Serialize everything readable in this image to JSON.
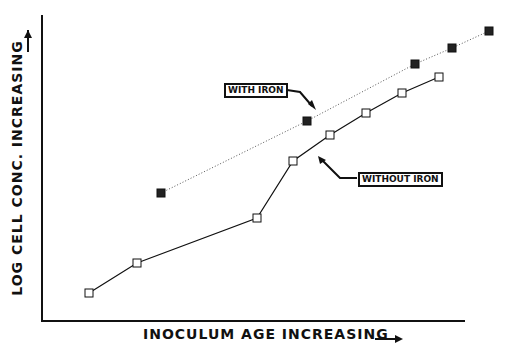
{
  "chart_data": {
    "type": "line",
    "title": "",
    "xlabel": "INOCULUM AGE INCREASING",
    "ylabel": "LOG CELL CONC. INCREASING",
    "grid": false,
    "legend": "annotations in boxes with arrows",
    "series": [
      {
        "name": "WITHOUT IRON",
        "style": "solid line, open squares",
        "points": [
          [
            89,
            293
          ],
          [
            137,
            263
          ],
          [
            257,
            218
          ],
          [
            293,
            161
          ],
          [
            330,
            135
          ],
          [
            366,
            113
          ],
          [
            402,
            93
          ],
          [
            439,
            77
          ]
        ]
      },
      {
        "name": "WITH IRON",
        "style": "dotted line, filled squares",
        "points": [
          [
            161,
            193
          ],
          [
            307,
            121
          ],
          [
            415,
            64
          ],
          [
            452,
            48
          ],
          [
            489,
            31
          ]
        ]
      }
    ],
    "annotations": [
      "WITH IRON",
      "WITHOUT IRON"
    ]
  },
  "labels": {
    "x": "INOCULUM AGE INCREASING",
    "y": "LOG CELL CONC. INCREASING",
    "with_iron": "WITH IRON",
    "without_iron": "WITHOUT IRON"
  }
}
